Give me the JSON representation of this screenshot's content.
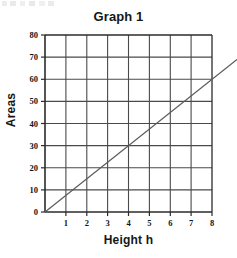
{
  "figure": {
    "title": "Graph 1",
    "background_color": "#ffffff",
    "grid_color": "#4a4a4a",
    "axis_color": "#2b2b2b",
    "line_color": "#5c5c5c",
    "text_color": "#161616"
  },
  "chart_data": {
    "type": "line",
    "title": "Graph 1",
    "subtitle": "",
    "xlabel": "Height h",
    "ylabel": "Areas",
    "xlim": [
      0,
      8
    ],
    "ylim": [
      0,
      80
    ],
    "xticks": [
      0,
      1,
      2,
      3,
      4,
      5,
      6,
      7,
      8
    ],
    "xtick_labels": [
      "",
      "1",
      "2",
      "3",
      "4",
      "5",
      "6",
      "7",
      "8"
    ],
    "yticks": [
      0,
      10,
      20,
      30,
      40,
      50,
      60,
      70,
      80
    ],
    "ytick_labels": [
      "0",
      "10",
      "20",
      "30",
      "40",
      "50",
      "60",
      "70",
      "80"
    ],
    "grid": true,
    "grid_style": "solid",
    "legend": false,
    "legend_position": "none",
    "annotations": [],
    "series": [
      {
        "name": "Area vs Height",
        "type": "line",
        "slope": 7.5,
        "intercept": 0,
        "color": "#5c5c5c",
        "extends_past_axis": true,
        "x": [
          0,
          1,
          2,
          3,
          4,
          5,
          6,
          7,
          8
        ],
        "values": [
          0,
          7.5,
          15,
          22.5,
          30,
          37.5,
          45,
          52.5,
          60
        ]
      }
    ]
  },
  "axes": {
    "y_title": "Areas",
    "x_title": "Height h",
    "y_tick_0": "0",
    "y_tick_10": "10",
    "y_tick_20": "20",
    "y_tick_30": "30",
    "y_tick_40": "40",
    "y_tick_50": "50",
    "y_tick_60": "60",
    "y_tick_70": "70",
    "y_tick_80": "80",
    "x_tick_1": "1",
    "x_tick_2": "2",
    "x_tick_3": "3",
    "x_tick_4": "4",
    "x_tick_5": "5",
    "x_tick_6": "6",
    "x_tick_7": "7",
    "x_tick_8": "8"
  }
}
